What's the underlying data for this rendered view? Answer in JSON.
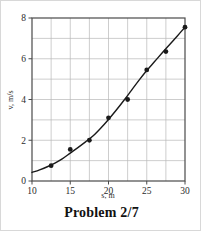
{
  "caption": "Problem 2/7",
  "chart_data": {
    "type": "scatter",
    "title": "",
    "subtitle": "",
    "xlabel": "s, m",
    "ylabel": "v, m/s",
    "xlim": [
      10,
      30
    ],
    "ylim": [
      0,
      8
    ],
    "xticks": [
      10,
      15,
      20,
      25,
      30
    ],
    "yticks": [
      0,
      2,
      4,
      6,
      8
    ],
    "xtick_labels": [
      "10",
      "15",
      "20",
      "25",
      "30"
    ],
    "ytick_labels": [
      "0",
      "2",
      "4",
      "6",
      "8"
    ],
    "grid": true,
    "grid_x_step": 2.5,
    "grid_y_step": 1,
    "legend": null,
    "legend_position": "none",
    "annotations": [],
    "marker": "filled-circle",
    "marker_color": "#1a1a1a",
    "line_color": "#1a1a1a",
    "x": [
      12.5,
      15,
      17.5,
      20,
      22.5,
      25,
      27.5,
      30
    ],
    "values": [
      0.75,
      1.55,
      2.0,
      3.1,
      4.0,
      5.45,
      6.35,
      7.55
    ],
    "series": [
      {
        "name": "measured speed",
        "x": [
          12.5,
          15,
          17.5,
          20,
          22.5,
          25,
          27.5,
          30
        ],
        "values": [
          0.75,
          1.55,
          2.0,
          3.1,
          4.0,
          5.45,
          6.35,
          7.55
        ]
      }
    ],
    "fit_curve": {
      "name": "smooth fit",
      "x": [
        10,
        11,
        12,
        13,
        14,
        15,
        16,
        17,
        18,
        19,
        20,
        21,
        22,
        23,
        24,
        25,
        26,
        27,
        28,
        29,
        30
      ],
      "values": [
        0.42,
        0.55,
        0.7,
        0.88,
        1.1,
        1.37,
        1.64,
        1.92,
        2.22,
        2.6,
        3.02,
        3.47,
        3.95,
        4.45,
        4.95,
        5.42,
        5.85,
        6.28,
        6.7,
        7.12,
        7.55
      ]
    }
  },
  "colors": {
    "axis": "#4a4a4a",
    "grid": "#b8b8b8",
    "data": "#1a1a1a",
    "text": "#2b2b2b",
    "background": "#ffffff"
  }
}
